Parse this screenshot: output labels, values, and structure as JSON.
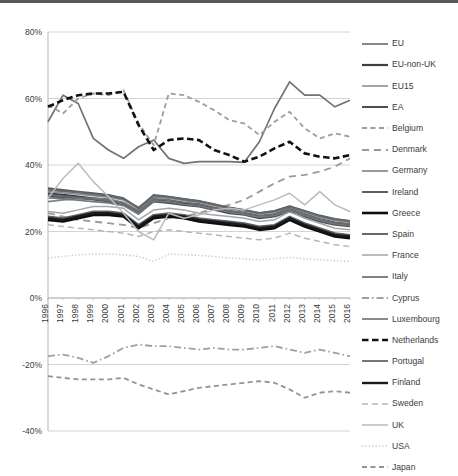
{
  "chart_data": {
    "type": "line",
    "title": "",
    "subtitle": "",
    "xlabel": "",
    "ylabel": "",
    "xlim": [
      1996,
      2016
    ],
    "ylim": [
      -40,
      80
    ],
    "grid": true,
    "legend_position": "right",
    "ytick_labels": [
      "80%",
      "60%",
      "40%",
      "20%",
      "0%",
      "-20%",
      "-40%"
    ],
    "ytick_values": [
      80,
      60,
      40,
      20,
      0,
      -20,
      -40
    ],
    "x": [
      1996,
      1997,
      1998,
      1999,
      2000,
      2001,
      2002,
      2003,
      2004,
      2005,
      2006,
      2007,
      2008,
      2009,
      2010,
      2011,
      2012,
      2013,
      2014,
      2015,
      2016
    ],
    "categories": [
      "1996",
      "1997",
      "1998",
      "1999",
      "2000",
      "2001",
      "2002",
      "2003",
      "2004",
      "2005",
      "2006",
      "2007",
      "2008",
      "2009",
      "2010",
      "2011",
      "2012",
      "2013",
      "2014",
      "2015",
      "2016"
    ],
    "series": [
      {
        "name": "EU",
        "style": "solid",
        "color": "#6f7377",
        "width": 1.7,
        "values": [
          53.0,
          61.0,
          58.5,
          48.0,
          44.5,
          42.0,
          45.5,
          47.5,
          42.0,
          40.5,
          41.0,
          41.0,
          41.0,
          40.8,
          47.0,
          57.0,
          65.0,
          61.0,
          61.0,
          57.5,
          59.5
        ]
      },
      {
        "name": "EU-non-UK",
        "style": "solid",
        "color": "#3d3f42",
        "width": 2.2,
        "values": [
          31.5,
          31.0,
          30.5,
          30.0,
          29.5,
          28.5,
          26.0,
          29.5,
          29.0,
          28.5,
          28.0,
          27.0,
          26.0,
          25.5,
          24.5,
          25.0,
          26.5,
          25.0,
          23.5,
          22.5,
          22.0
        ]
      },
      {
        "name": "EU15",
        "style": "solid",
        "color": "#8b8f93",
        "width": 1.6,
        "values": [
          32.0,
          31.6,
          31.2,
          30.8,
          30.3,
          29.5,
          27.0,
          30.5,
          30.0,
          29.3,
          28.8,
          27.8,
          26.8,
          26.2,
          25.3,
          25.8,
          27.2,
          25.8,
          24.3,
          23.3,
          22.8
        ]
      },
      {
        "name": "EA",
        "style": "solid",
        "color": "#4c4f52",
        "width": 2.0,
        "values": [
          30.6,
          30.3,
          30.0,
          29.6,
          29.0,
          28.2,
          25.5,
          29.0,
          28.6,
          28.0,
          27.5,
          26.5,
          25.5,
          25.0,
          24.0,
          24.5,
          26.0,
          24.5,
          23.0,
          22.0,
          21.6
        ]
      },
      {
        "name": "Belgium",
        "style": "dashed",
        "color": "#9a9ea2",
        "width": 1.8,
        "values": [
          58.0,
          55.5,
          60.0,
          61.5,
          61.0,
          62.5,
          52.5,
          46.0,
          61.5,
          61.0,
          59.0,
          56.5,
          53.5,
          52.5,
          49.0,
          53.0,
          56.0,
          51.0,
          48.0,
          49.5,
          48.5
        ]
      },
      {
        "name": "Denmark",
        "style": "longdash",
        "color": "#97999c",
        "width": 1.8,
        "values": [
          25.5,
          24.5,
          23.5,
          23.0,
          22.5,
          22.0,
          21.0,
          22.5,
          24.0,
          24.5,
          25.5,
          27.0,
          28.0,
          29.5,
          32.0,
          34.5,
          36.5,
          37.0,
          38.0,
          39.5,
          42.0
        ]
      },
      {
        "name": "Germany",
        "style": "solid",
        "color": "#7e8286",
        "width": 1.6,
        "values": [
          29.0,
          29.5,
          29.8,
          30.0,
          29.8,
          28.8,
          26.4,
          30.2,
          30.3,
          29.5,
          29.0,
          28.2,
          27.0,
          26.4,
          25.4,
          26.0,
          27.4,
          26.0,
          24.6,
          23.6,
          23.0
        ]
      },
      {
        "name": "Ireland",
        "style": "solid",
        "color": "#56595c",
        "width": 1.9,
        "values": [
          33.0,
          32.5,
          32.0,
          31.5,
          31.0,
          30.0,
          27.0,
          31.0,
          30.5,
          29.8,
          29.2,
          28.2,
          27.2,
          26.5,
          25.6,
          26.2,
          27.6,
          26.2,
          24.8,
          23.8,
          23.2
        ]
      },
      {
        "name": "Greece",
        "style": "solid",
        "color": "#0d0d0d",
        "width": 2.6,
        "values": [
          23.5,
          23.0,
          24.0,
          25.0,
          25.0,
          24.5,
          21.0,
          24.0,
          24.5,
          24.0,
          23.0,
          22.5,
          22.0,
          21.5,
          20.5,
          21.0,
          23.5,
          21.5,
          20.0,
          18.5,
          18.0
        ]
      },
      {
        "name": "Spain",
        "style": "solid",
        "color": "#5e6164",
        "width": 1.9,
        "values": [
          24.5,
          24.0,
          25.0,
          26.0,
          26.0,
          25.5,
          22.0,
          25.0,
          25.5,
          25.0,
          24.0,
          23.5,
          23.0,
          22.5,
          21.5,
          22.0,
          24.5,
          22.5,
          21.0,
          19.5,
          19.0
        ]
      },
      {
        "name": "France",
        "style": "solid",
        "color": "#a2a6aa",
        "width": 1.5,
        "values": [
          26.0,
          25.5,
          26.5,
          27.5,
          27.5,
          27.0,
          23.5,
          26.5,
          27.0,
          26.5,
          25.5,
          25.0,
          24.5,
          24.0,
          23.0,
          23.5,
          26.0,
          24.0,
          22.5,
          21.0,
          20.5
        ]
      },
      {
        "name": "Italy",
        "style": "solid",
        "color": "#6a6d70",
        "width": 1.7,
        "values": [
          31.0,
          30.6,
          30.2,
          29.8,
          29.3,
          28.4,
          25.8,
          29.8,
          29.5,
          28.8,
          28.3,
          27.3,
          26.3,
          25.7,
          24.8,
          25.3,
          26.8,
          25.3,
          23.8,
          22.8,
          22.3
        ]
      },
      {
        "name": "Cyprus",
        "style": "dashdot",
        "color": "#9da1a5",
        "width": 1.8,
        "values": [
          -17.5,
          -17.0,
          -18.0,
          -19.5,
          -17.5,
          -15.0,
          -14.0,
          -14.5,
          -14.5,
          -15.0,
          -15.5,
          -15.0,
          -15.5,
          -15.5,
          -15.0,
          -14.5,
          -15.5,
          -16.5,
          -15.5,
          -16.5,
          -17.5
        ]
      },
      {
        "name": "Luxembourg",
        "style": "solid",
        "color": "#73777b",
        "width": 1.7,
        "values": [
          30.2,
          29.8,
          29.4,
          29.0,
          28.6,
          27.8,
          25.2,
          29.2,
          28.9,
          28.2,
          27.7,
          26.8,
          25.8,
          25.2,
          24.3,
          24.8,
          26.2,
          24.8,
          23.3,
          22.3,
          21.8
        ]
      },
      {
        "name": "Netherlands",
        "style": "bolddash",
        "color": "#111111",
        "width": 2.6,
        "values": [
          57.5,
          59.5,
          61.0,
          61.5,
          61.5,
          62.0,
          52.0,
          44.5,
          47.5,
          48.0,
          47.5,
          44.5,
          43.0,
          41.0,
          42.5,
          45.0,
          47.0,
          43.5,
          42.5,
          42.0,
          43.0
        ]
      },
      {
        "name": "Portugal",
        "style": "solid",
        "color": "#65686b",
        "width": 1.8,
        "values": [
          32.5,
          32.1,
          31.7,
          31.2,
          30.7,
          29.8,
          27.2,
          30.8,
          30.4,
          29.7,
          29.1,
          28.1,
          27.1,
          26.4,
          25.5,
          26.1,
          27.5,
          26.1,
          24.7,
          23.7,
          23.1
        ]
      },
      {
        "name": "Finland",
        "style": "solid",
        "color": "#1a1a1a",
        "width": 2.4,
        "values": [
          24.0,
          23.5,
          24.5,
          25.5,
          25.5,
          25.0,
          21.5,
          24.5,
          25.0,
          24.5,
          23.5,
          23.0,
          22.5,
          22.0,
          21.0,
          21.5,
          24.0,
          22.0,
          20.5,
          19.0,
          18.5
        ]
      },
      {
        "name": "Sweden",
        "style": "mediumdash",
        "color": "#b2b6ba",
        "width": 1.5,
        "values": [
          22.0,
          21.5,
          21.0,
          20.5,
          20.0,
          19.5,
          18.5,
          20.0,
          20.5,
          20.0,
          19.5,
          19.0,
          18.5,
          18.0,
          17.5,
          18.0,
          19.5,
          18.0,
          17.0,
          16.0,
          15.5
        ]
      },
      {
        "name": "UK",
        "style": "solid",
        "color": "#b8bcc0",
        "width": 1.5,
        "values": [
          30.0,
          36.0,
          40.5,
          35.0,
          30.5,
          25.5,
          20.0,
          17.5,
          25.5,
          24.0,
          25.0,
          26.5,
          27.0,
          26.5,
          28.0,
          29.5,
          31.5,
          28.0,
          32.0,
          28.0,
          26.0
        ]
      },
      {
        "name": "USA",
        "style": "dotted",
        "color": "#c2c6ca",
        "width": 1.5,
        "values": [
          12.0,
          12.5,
          13.0,
          13.2,
          13.2,
          13.0,
          12.5,
          11.0,
          13.2,
          13.0,
          12.8,
          12.5,
          12.0,
          11.8,
          11.5,
          11.8,
          12.2,
          11.8,
          11.5,
          11.2,
          11.0
        ]
      },
      {
        "name": "Japan",
        "style": "dashed",
        "color": "#8f9397",
        "width": 1.8,
        "values": [
          -23.5,
          -24.0,
          -24.5,
          -24.5,
          -24.5,
          -24.0,
          -26.0,
          -27.5,
          -29.0,
          -28.0,
          -27.0,
          -26.5,
          -26.0,
          -25.5,
          -25.0,
          -25.5,
          -27.5,
          -30.0,
          -28.5,
          -28.0,
          -28.5
        ]
      }
    ]
  },
  "legend": {
    "items": [
      {
        "label": "EU"
      },
      {
        "label": "EU-non-UK"
      },
      {
        "label": "EU15"
      },
      {
        "label": "EA"
      },
      {
        "label": "Belgium"
      },
      {
        "label": "Denmark"
      },
      {
        "label": "Germany"
      },
      {
        "label": "Ireland"
      },
      {
        "label": "Greece"
      },
      {
        "label": "Spain"
      },
      {
        "label": "France"
      },
      {
        "label": "Italy"
      },
      {
        "label": "Cyprus"
      },
      {
        "label": "Luxembourg"
      },
      {
        "label": "Netherlands"
      },
      {
        "label": "Portugal"
      },
      {
        "label": "Finland"
      },
      {
        "label": "Sweden"
      },
      {
        "label": "UK"
      },
      {
        "label": "USA"
      },
      {
        "label": "Japan"
      }
    ]
  },
  "colors": {
    "grid": "#c9c9c9",
    "axis": "#b5b5b5",
    "text": "#3b3b3b",
    "background": "#ffffff",
    "top_edge": "#55585a"
  }
}
